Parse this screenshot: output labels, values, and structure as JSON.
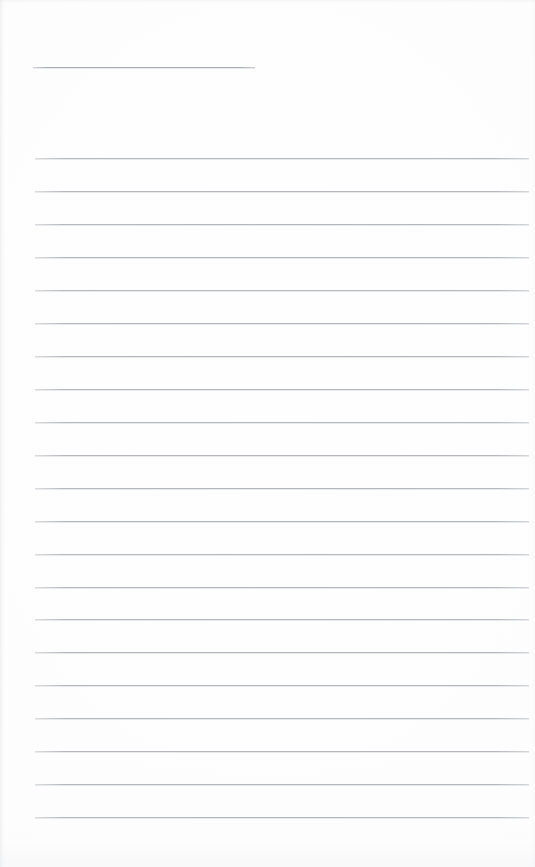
{
  "document": {
    "kind": "scanned-ruled-page",
    "description": "Blank scanned ruled notepaper page with a short header rule and a stack of full-width writing rules",
    "page_width": 535,
    "page_height": 867,
    "background_color": "#fdfdfd",
    "rule_color": "#b4b8bd",
    "header_rule_color": "#a9adb3",
    "text_content": ""
  },
  "header_rule": {
    "label": "header-rule",
    "x": 33,
    "y": 67,
    "width": 222,
    "height": 1
  },
  "body_rules": {
    "label": "body-rules",
    "count": 21,
    "x": 35,
    "width": 494,
    "first_y": 158,
    "spacing": 32.95,
    "height": 1,
    "lines": [
      {
        "index": 1,
        "y": 158,
        "text": ""
      },
      {
        "index": 2,
        "y": 191,
        "text": ""
      },
      {
        "index": 3,
        "y": 224,
        "text": ""
      },
      {
        "index": 4,
        "y": 257,
        "text": ""
      },
      {
        "index": 5,
        "y": 290,
        "text": ""
      },
      {
        "index": 6,
        "y": 323,
        "text": ""
      },
      {
        "index": 7,
        "y": 356,
        "text": ""
      },
      {
        "index": 8,
        "y": 389,
        "text": ""
      },
      {
        "index": 9,
        "y": 422,
        "text": ""
      },
      {
        "index": 10,
        "y": 455,
        "text": ""
      },
      {
        "index": 11,
        "y": 488,
        "text": ""
      },
      {
        "index": 12,
        "y": 521,
        "text": ""
      },
      {
        "index": 13,
        "y": 554,
        "text": ""
      },
      {
        "index": 14,
        "y": 587,
        "text": ""
      },
      {
        "index": 15,
        "y": 619,
        "text": ""
      },
      {
        "index": 16,
        "y": 652,
        "text": ""
      },
      {
        "index": 17,
        "y": 685,
        "text": ""
      },
      {
        "index": 18,
        "y": 718,
        "text": ""
      },
      {
        "index": 19,
        "y": 751,
        "text": ""
      },
      {
        "index": 20,
        "y": 784,
        "text": ""
      },
      {
        "index": 21,
        "y": 817,
        "text": ""
      }
    ]
  }
}
